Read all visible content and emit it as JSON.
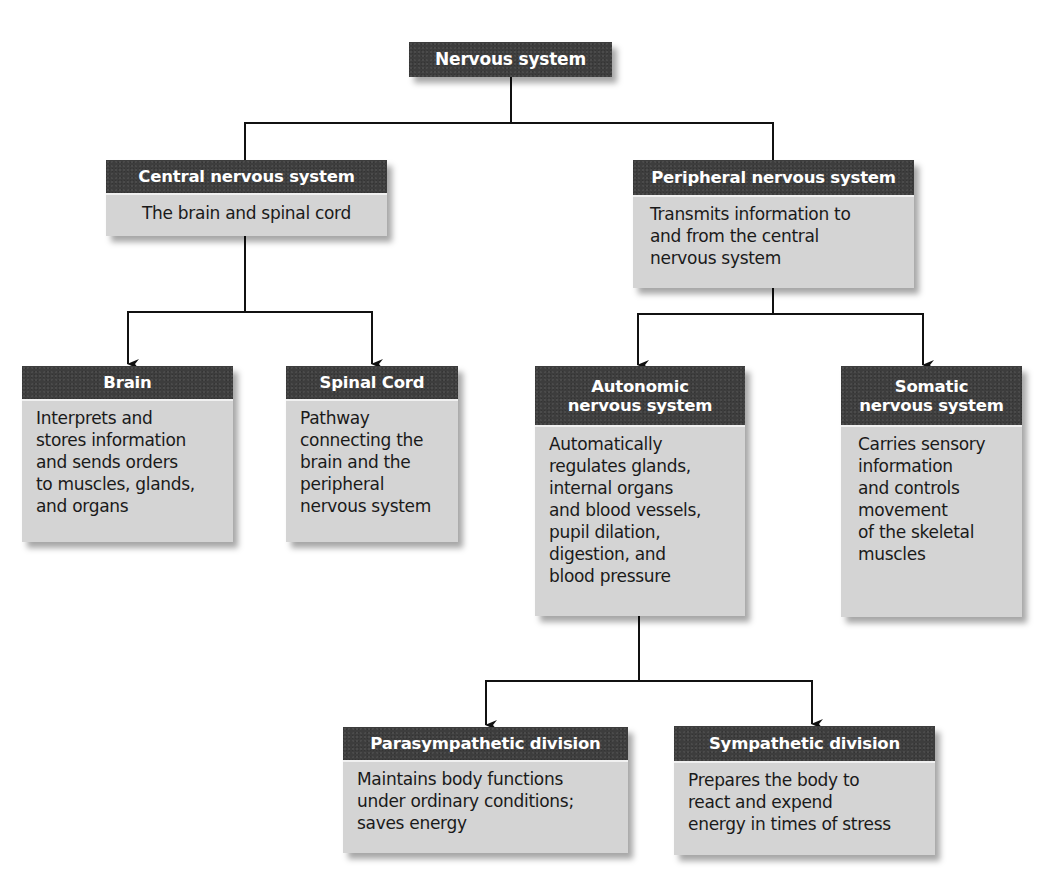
{
  "diagram": {
    "root": {
      "title": "Nervous system"
    },
    "cns": {
      "title": "Central nervous system",
      "description_lines": [
        "The brain and spinal cord"
      ]
    },
    "pns": {
      "title": "Peripheral nervous system",
      "description_lines": [
        "Transmits information to",
        "and from the central",
        "nervous system"
      ]
    },
    "brain": {
      "title": "Brain",
      "description_lines": [
        "Interprets and",
        "stores information",
        "and sends orders",
        "to muscles, glands,",
        "and organs"
      ]
    },
    "spinal_cord": {
      "title": "Spinal Cord",
      "description_lines": [
        "Pathway",
        "connecting the",
        "brain and the",
        "peripheral",
        "nervous system"
      ]
    },
    "autonomic": {
      "title_lines": [
        "Autonomic",
        "nervous system"
      ],
      "description_lines": [
        "Automatically",
        "regulates glands,",
        "internal organs",
        "and blood vessels,",
        "pupil dilation,",
        "digestion, and",
        "blood pressure"
      ]
    },
    "somatic": {
      "title_lines": [
        "Somatic",
        "nervous system"
      ],
      "description_lines": [
        "Carries sensory",
        "information",
        "and controls",
        "movement",
        "of the skeletal",
        "muscles"
      ]
    },
    "parasympathetic": {
      "title": "Parasympathetic division",
      "description_lines": [
        "Maintains body functions",
        "under ordinary conditions;",
        "saves energy"
      ]
    },
    "sympathetic": {
      "title": "Sympathetic division",
      "description_lines": [
        "Prepares the body to",
        "react and expend",
        "energy in times of stress"
      ]
    }
  },
  "colors": {
    "header_bg": "#3d3d3d",
    "body_bg": "#d4d4d4",
    "header_text": "#ffffff",
    "body_text": "#1a1a1a",
    "line": "#111111"
  }
}
